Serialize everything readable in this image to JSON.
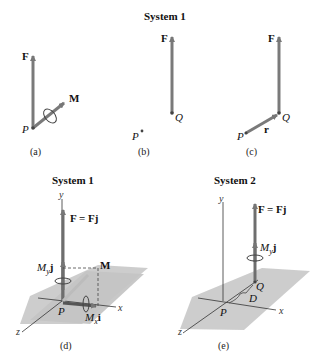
{
  "top": {
    "title": "System 1",
    "panel_a": {
      "force_label": "F",
      "moment_label": "M",
      "point_label": "P",
      "caption": "(a)"
    },
    "panel_b": {
      "force_label": "F",
      "point_q_label": "Q",
      "point_p_label": "P",
      "caption": "(b)"
    },
    "panel_c": {
      "force_label": "F",
      "point_q_label": "Q",
      "point_p_label": "P",
      "position_label": "r",
      "caption": "(c)"
    }
  },
  "bottom_left": {
    "title": "System 1",
    "y_axis": "y",
    "x_axis": "x",
    "z_axis": "z",
    "force_label": "F = Fj",
    "my_label": "M",
    "my_sub": "y",
    "my_vec": "j",
    "mx_label": "M",
    "mx_sub": "x",
    "mx_vec": "i",
    "moment_label": "M",
    "point_label": "P",
    "caption": "(d)"
  },
  "bottom_right": {
    "title": "System 2",
    "y_axis": "y",
    "x_axis": "x",
    "z_axis": "z",
    "force_label": "F = Fj",
    "my_label": "M",
    "my_sub": "y",
    "my_vec": "j",
    "point_p_label": "P",
    "point_q_label": "Q",
    "distance_label": "D",
    "caption": "(e)"
  },
  "colors": {
    "vector": "#7a7a7a",
    "plane": "#c8c8c8",
    "axis": "#333333"
  }
}
